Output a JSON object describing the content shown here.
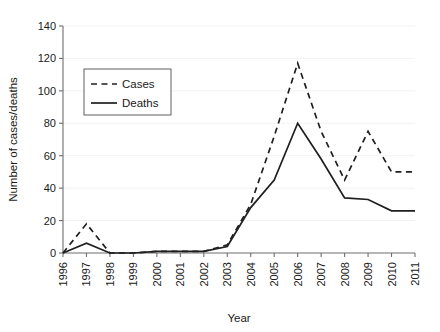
{
  "chart_data": {
    "type": "line",
    "title": "",
    "xlabel": "Year",
    "ylabel": "Number of cases/deaths",
    "x": [
      1996,
      1997,
      1998,
      1999,
      2000,
      2001,
      2002,
      2003,
      2004,
      2005,
      2006,
      2007,
      2008,
      2009,
      2010,
      2011
    ],
    "xtick_labels": [
      "1996",
      "1997",
      "1998",
      "1999",
      "2000",
      "2001",
      "2002",
      "2003",
      "2004",
      "2005",
      "2006",
      "2007",
      "2008",
      "2009",
      "2010",
      "2011"
    ],
    "ytick_labels": [
      "0",
      "20",
      "40",
      "60",
      "80",
      "100",
      "120",
      "140"
    ],
    "yticks": [
      0,
      20,
      40,
      60,
      80,
      100,
      120,
      140
    ],
    "ylim": [
      0,
      140
    ],
    "xlim": [
      1996,
      2011
    ],
    "grid": true,
    "legend_position": "upper-left-inside",
    "series": [
      {
        "name": "Cases",
        "style": "dashed",
        "color": "#1f1f1f",
        "values": [
          0,
          18,
          0,
          0,
          1,
          1,
          1,
          5,
          30,
          72,
          117,
          75,
          45,
          75,
          50,
          50
        ]
      },
      {
        "name": "Deaths",
        "style": "solid",
        "color": "#1f1f1f",
        "values": [
          0,
          6,
          0,
          0,
          1,
          1,
          1,
          4,
          28,
          45,
          80,
          58,
          34,
          33,
          26,
          26
        ]
      }
    ]
  },
  "legend": {
    "entries": [
      {
        "label": "Cases"
      },
      {
        "label": "Deaths"
      }
    ]
  },
  "axes": {
    "x_title": "Year",
    "y_title": "Number of cases/deaths"
  }
}
